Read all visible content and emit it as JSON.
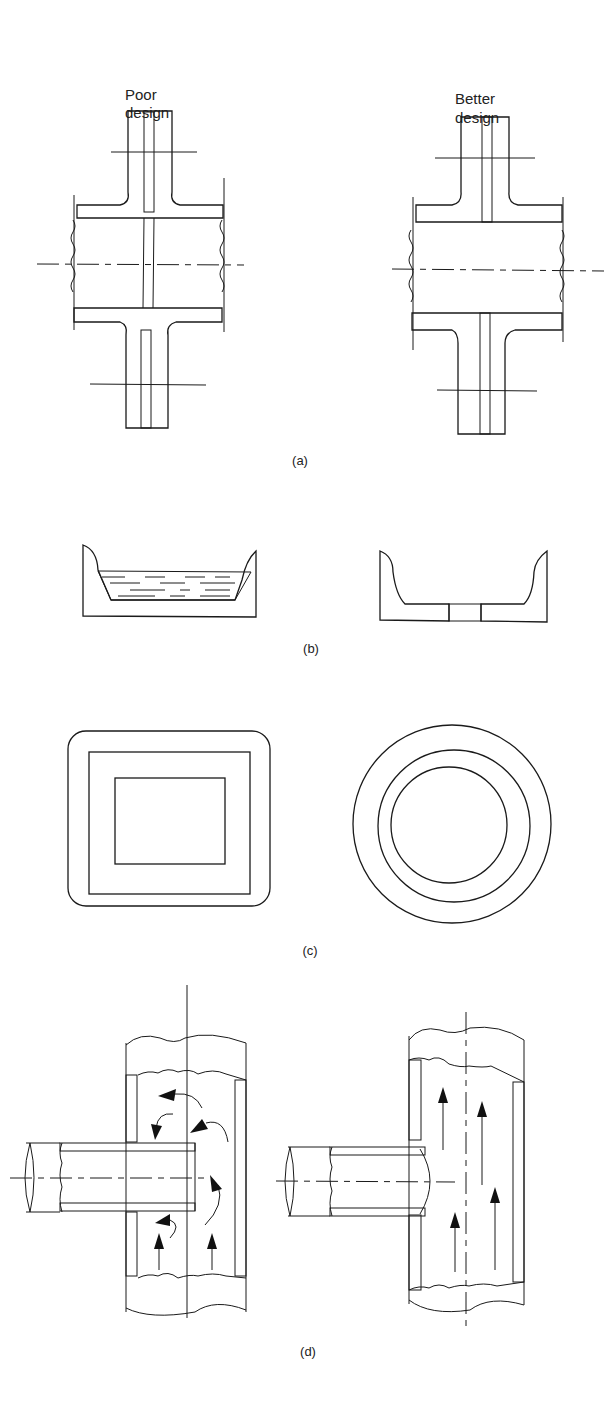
{
  "column_headers": {
    "poor": [
      "Poor",
      "design"
    ],
    "better": [
      "Better",
      "design"
    ]
  },
  "panels": [
    {
      "id": "a",
      "caption": "(a)",
      "description": "Flanged pipe joint with gasket; poor design gasket protrudes into bore, better design gasket flush with bore"
    },
    {
      "id": "b",
      "caption": "(b)",
      "description": "Tank bottom; poor design retains liquid, better design has drain hole"
    },
    {
      "id": "c",
      "caption": "(c)",
      "description": "Cross-section; poor design square hollow section, better design circular tube"
    },
    {
      "id": "d",
      "caption": "(d)",
      "description": "Branch pipe T-joint; poor design protruding branch causes turbulence, better design flush branch gives smooth flow"
    }
  ],
  "colors": {
    "ink": "#1a1a1a",
    "background": "#ffffff"
  }
}
